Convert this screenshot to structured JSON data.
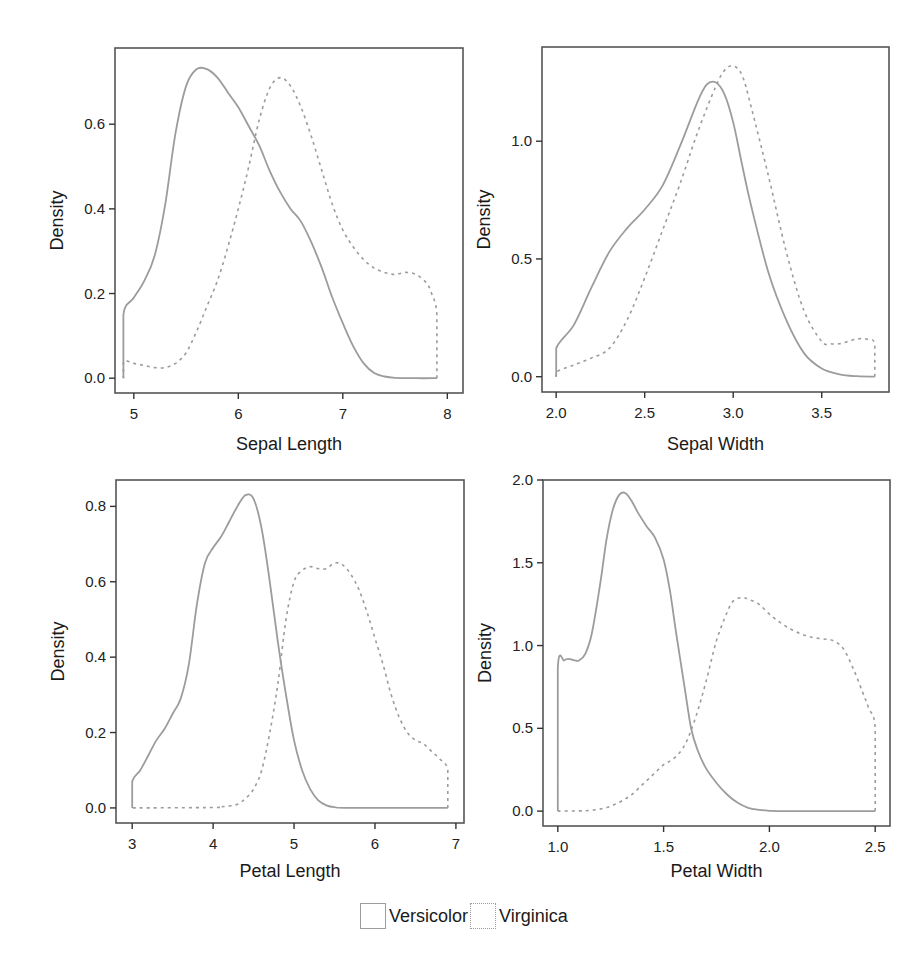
{
  "legend": {
    "items": [
      {
        "label": "Versicolor",
        "style": "solid"
      },
      {
        "label": "Virginica",
        "style": "dashed"
      }
    ]
  },
  "colors": {
    "curve": "#9c9c9c",
    "frame": "#555555",
    "text": "#1a1a1a"
  },
  "chart_data": [
    {
      "type": "line",
      "title": "",
      "xlabel": "Sepal Length",
      "ylabel": "Density",
      "xticks": [
        5,
        6,
        7,
        8
      ],
      "xtick_labels": [
        "5",
        "6",
        "7",
        "8"
      ],
      "yticks": [
        0.0,
        0.2,
        0.4,
        0.6
      ],
      "ytick_labels": [
        "0.0",
        "0.2",
        "0.4",
        "0.6"
      ],
      "xlim": [
        4.82,
        8.15
      ],
      "ylim": [
        -0.035,
        0.78
      ],
      "grid": false,
      "series": [
        {
          "name": "Versicolor",
          "style": "solid",
          "x": [
            4.9,
            4.9,
            5.0,
            5.1,
            5.2,
            5.3,
            5.4,
            5.5,
            5.6,
            5.7,
            5.8,
            5.9,
            6.0,
            6.1,
            6.2,
            6.3,
            6.4,
            6.5,
            6.6,
            6.7,
            6.8,
            6.9,
            7.0,
            7.1,
            7.2,
            7.3,
            7.4,
            7.5,
            7.7,
            7.9,
            7.9
          ],
          "y": [
            0.0,
            0.15,
            0.19,
            0.23,
            0.29,
            0.41,
            0.58,
            0.69,
            0.73,
            0.73,
            0.71,
            0.675,
            0.64,
            0.595,
            0.55,
            0.49,
            0.44,
            0.4,
            0.37,
            0.32,
            0.26,
            0.19,
            0.13,
            0.075,
            0.035,
            0.012,
            0.004,
            0.001,
            0.0,
            0.0,
            0.0
          ]
        },
        {
          "name": "Virginica",
          "style": "dashed",
          "x": [
            7.9,
            7.9,
            7.85,
            7.8,
            7.7,
            7.6,
            7.5,
            7.4,
            7.3,
            7.2,
            7.1,
            7.0,
            6.9,
            6.8,
            6.7,
            6.6,
            6.5,
            6.4,
            6.3,
            6.2,
            6.1,
            6.0,
            5.9,
            5.8,
            5.7,
            5.6,
            5.5,
            5.4,
            5.3,
            5.2,
            5.1,
            5.0,
            4.9,
            4.9
          ],
          "y": [
            0.0,
            0.15,
            0.2,
            0.225,
            0.245,
            0.25,
            0.245,
            0.25,
            0.26,
            0.28,
            0.31,
            0.35,
            0.41,
            0.49,
            0.57,
            0.64,
            0.69,
            0.71,
            0.685,
            0.61,
            0.5,
            0.4,
            0.31,
            0.23,
            0.17,
            0.11,
            0.06,
            0.035,
            0.025,
            0.025,
            0.03,
            0.035,
            0.04,
            0.0
          ]
        }
      ]
    },
    {
      "type": "line",
      "title": "",
      "xlabel": "Sepal Width",
      "ylabel": "Density",
      "xticks": [
        2.0,
        2.5,
        3.0,
        3.5
      ],
      "xtick_labels": [
        "2.0",
        "2.5",
        "3.0",
        "3.5"
      ],
      "yticks": [
        0.0,
        0.5,
        1.0
      ],
      "ytick_labels": [
        "0.0",
        "0.5",
        "1.0"
      ],
      "xlim": [
        1.92,
        3.88
      ],
      "ylim": [
        -0.065,
        1.4
      ],
      "grid": false,
      "series": [
        {
          "name": "Versicolor",
          "style": "solid",
          "x": [
            2.0,
            2.0,
            2.1,
            2.2,
            2.3,
            2.4,
            2.5,
            2.6,
            2.7,
            2.8,
            2.85,
            2.9,
            2.95,
            3.0,
            3.05,
            3.1,
            3.2,
            3.3,
            3.4,
            3.5,
            3.6,
            3.7,
            3.8,
            3.8
          ],
          "y": [
            0.0,
            0.12,
            0.22,
            0.38,
            0.53,
            0.63,
            0.71,
            0.81,
            0.98,
            1.17,
            1.24,
            1.25,
            1.2,
            1.08,
            0.9,
            0.73,
            0.44,
            0.24,
            0.1,
            0.035,
            0.01,
            0.002,
            0.0,
            0.0
          ]
        },
        {
          "name": "Virginica",
          "style": "dashed",
          "x": [
            3.8,
            3.8,
            3.75,
            3.7,
            3.65,
            3.6,
            3.55,
            3.5,
            3.4,
            3.3,
            3.2,
            3.1,
            3.05,
            3.0,
            2.95,
            2.9,
            2.8,
            2.7,
            2.6,
            2.5,
            2.4,
            2.3,
            2.2,
            2.1,
            2.0,
            2.0
          ],
          "y": [
            0.0,
            0.14,
            0.16,
            0.16,
            0.15,
            0.14,
            0.14,
            0.15,
            0.28,
            0.53,
            0.85,
            1.15,
            1.28,
            1.32,
            1.3,
            1.23,
            1.04,
            0.82,
            0.62,
            0.42,
            0.24,
            0.12,
            0.08,
            0.05,
            0.02,
            0.0
          ]
        }
      ]
    },
    {
      "type": "line",
      "title": "",
      "xlabel": "Petal Length",
      "ylabel": "Density",
      "xticks": [
        3,
        4,
        5,
        6,
        7
      ],
      "xtick_labels": [
        "3",
        "4",
        "5",
        "6",
        "7"
      ],
      "yticks": [
        0.0,
        0.2,
        0.4,
        0.6,
        0.8
      ],
      "ytick_labels": [
        "0.0",
        "0.2",
        "0.4",
        "0.6",
        "0.8"
      ],
      "xlim": [
        2.8,
        7.1
      ],
      "ylim": [
        -0.04,
        0.87
      ],
      "grid": false,
      "series": [
        {
          "name": "Versicolor",
          "style": "solid",
          "x": [
            3.0,
            3.0,
            3.1,
            3.2,
            3.3,
            3.4,
            3.5,
            3.6,
            3.7,
            3.8,
            3.9,
            4.0,
            4.1,
            4.2,
            4.3,
            4.4,
            4.5,
            4.6,
            4.7,
            4.8,
            4.9,
            5.0,
            5.1,
            5.2,
            5.3,
            5.4,
            5.5,
            5.7,
            6.9,
            6.9
          ],
          "y": [
            0.0,
            0.07,
            0.1,
            0.14,
            0.18,
            0.21,
            0.25,
            0.29,
            0.38,
            0.54,
            0.65,
            0.69,
            0.72,
            0.76,
            0.8,
            0.83,
            0.82,
            0.74,
            0.6,
            0.44,
            0.3,
            0.18,
            0.1,
            0.05,
            0.02,
            0.007,
            0.002,
            0.0,
            0.0,
            0.0
          ]
        },
        {
          "name": "Virginica",
          "style": "dashed",
          "x": [
            6.9,
            6.9,
            6.8,
            6.7,
            6.6,
            6.5,
            6.4,
            6.3,
            6.2,
            6.1,
            6.0,
            5.9,
            5.8,
            5.7,
            5.6,
            5.5,
            5.4,
            5.3,
            5.2,
            5.1,
            5.0,
            4.9,
            4.8,
            4.7,
            4.6,
            4.5,
            4.4,
            4.3,
            4.2,
            4.1,
            4.0,
            3.0,
            3.0
          ],
          "y": [
            0.0,
            0.1,
            0.13,
            0.15,
            0.17,
            0.18,
            0.2,
            0.24,
            0.3,
            0.38,
            0.45,
            0.52,
            0.58,
            0.62,
            0.645,
            0.65,
            0.635,
            0.635,
            0.64,
            0.63,
            0.6,
            0.5,
            0.33,
            0.2,
            0.1,
            0.05,
            0.025,
            0.01,
            0.005,
            0.003,
            0.001,
            0.0,
            0.0
          ]
        }
      ]
    },
    {
      "type": "line",
      "title": "",
      "xlabel": "Petal Width",
      "ylabel": "Density",
      "xticks": [
        1.0,
        1.5,
        2.0,
        2.5
      ],
      "xtick_labels": [
        "1.0",
        "1.5",
        "2.0",
        "2.5"
      ],
      "yticks": [
        0.0,
        0.5,
        1.0,
        1.5,
        2.0
      ],
      "ytick_labels": [
        "0.0",
        "0.5",
        "1.0",
        "1.5",
        "2.0"
      ],
      "xlim": [
        0.93,
        2.57
      ],
      "ylim": [
        -0.09,
        2.0
      ],
      "grid": false,
      "series": [
        {
          "name": "Versicolor",
          "style": "solid",
          "x": [
            1.0,
            1.0,
            1.03,
            1.05,
            1.08,
            1.1,
            1.13,
            1.16,
            1.2,
            1.23,
            1.26,
            1.29,
            1.32,
            1.35,
            1.38,
            1.42,
            1.46,
            1.5,
            1.53,
            1.56,
            1.6,
            1.63,
            1.66,
            1.7,
            1.75,
            1.8,
            1.85,
            1.9,
            1.95,
            2.0,
            2.1,
            2.5,
            2.5
          ],
          "y": [
            0.0,
            0.86,
            0.91,
            0.92,
            0.91,
            0.91,
            0.95,
            1.07,
            1.37,
            1.64,
            1.82,
            1.91,
            1.92,
            1.87,
            1.8,
            1.72,
            1.65,
            1.52,
            1.33,
            1.07,
            0.74,
            0.5,
            0.37,
            0.26,
            0.17,
            0.1,
            0.05,
            0.02,
            0.008,
            0.002,
            0.0,
            0.0,
            0.0
          ]
        },
        {
          "name": "Virginica",
          "style": "dashed",
          "x": [
            2.5,
            2.5,
            2.47,
            2.44,
            2.4,
            2.35,
            2.3,
            2.25,
            2.2,
            2.15,
            2.1,
            2.05,
            2.0,
            1.95,
            1.9,
            1.87,
            1.83,
            1.8,
            1.75,
            1.7,
            1.65,
            1.6,
            1.55,
            1.5,
            1.45,
            1.4,
            1.35,
            1.3,
            1.25,
            1.2,
            1.15,
            1.1,
            1.0,
            1.0
          ],
          "y": [
            0.0,
            0.5,
            0.62,
            0.72,
            0.85,
            0.98,
            1.03,
            1.04,
            1.05,
            1.07,
            1.1,
            1.14,
            1.19,
            1.25,
            1.28,
            1.29,
            1.27,
            1.2,
            1.03,
            0.78,
            0.56,
            0.4,
            0.32,
            0.28,
            0.22,
            0.16,
            0.1,
            0.06,
            0.03,
            0.012,
            0.004,
            0.001,
            0.0,
            0.0
          ]
        }
      ]
    }
  ]
}
